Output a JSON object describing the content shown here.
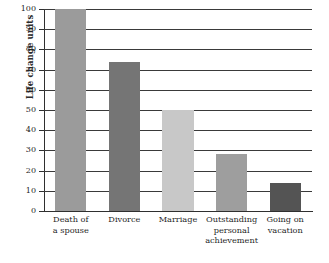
{
  "chart_data": {
    "type": "bar",
    "title": "",
    "subtitle": "",
    "xlabel": "",
    "ylabel": "Life change units",
    "categories": [
      "Death of a spouse",
      "Divorce",
      "Marriage",
      "Outstanding personal achievement",
      "Going on vacation"
    ],
    "category_lines": [
      [
        "Death of",
        "a spouse"
      ],
      [
        "Divorce"
      ],
      [
        "Marriage"
      ],
      [
        "Outstanding",
        "personal",
        "achievement"
      ],
      [
        "Going on",
        "vacation"
      ]
    ],
    "values": [
      100,
      74,
      50,
      28,
      14
    ],
    "bar_colors": [
      "#9b9b9b",
      "#757575",
      "#c8c8c8",
      "#9e9e9e",
      "#545454"
    ],
    "ylim": [
      0,
      100
    ],
    "yticks": [
      0,
      10,
      20,
      30,
      40,
      50,
      60,
      70,
      80,
      90,
      100
    ],
    "ytick_labels": [
      "0",
      "10",
      "20",
      "30",
      "40",
      "50",
      "60",
      "70",
      "80",
      "90",
      "100"
    ],
    "grid": true,
    "grid_axis": "y",
    "legend": false,
    "legend_position": "none",
    "background": "#ffffff",
    "axis_color": "#2f2f2f",
    "gridline_color": "#3a3a3a"
  }
}
